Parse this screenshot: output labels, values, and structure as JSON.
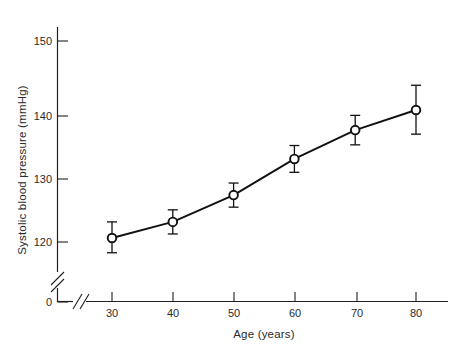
{
  "chart_data": {
    "type": "line",
    "title": "",
    "subtitle": "",
    "xlabel": "Age (years)",
    "ylabel": "Systolic blood pressure (mmHg)",
    "x": [
      30,
      40,
      50,
      60,
      70,
      80
    ],
    "values": [
      120.6,
      123.0,
      127.0,
      132.4,
      136.7,
      139.7
    ],
    "series": [
      {
        "name": "Systolic blood pressure",
        "values": [
          120.6,
          123.0,
          127.0,
          132.4,
          136.7,
          139.7
        ],
        "error_low": [
          118.4,
          121.2,
          125.2,
          130.4,
          134.5,
          136.1
        ],
        "error_high": [
          123.0,
          124.8,
          128.8,
          134.4,
          138.9,
          143.4
        ],
        "marker": "open-circle",
        "line_style": "solid",
        "color": "#111111"
      }
    ],
    "xticks": [
      30,
      40,
      50,
      60,
      70,
      80
    ],
    "xtick_labels": [
      "30",
      "40",
      "50",
      "60",
      "70",
      "80"
    ],
    "yticks": [
      0,
      120,
      130,
      140,
      150
    ],
    "ytick_labels": [
      "0",
      "120",
      "130",
      "140",
      "150"
    ],
    "xlim": [
      24,
      86
    ],
    "ylim": [
      0,
      153
    ],
    "grid": false,
    "legend": false,
    "legend_position": "none",
    "axis_breaks": {
      "y_break_between": [
        0,
        120
      ],
      "x_break_between": [
        0,
        30
      ]
    },
    "annotations": []
  },
  "axis": {
    "y_title": "Systolic blood pressure (mmHg)",
    "x_title": "Age (years)",
    "y_ticks": [
      {
        "label": "150",
        "value": 150
      },
      {
        "label": "140",
        "value": 140
      },
      {
        "label": "130",
        "value": 130
      },
      {
        "label": "120",
        "value": 120
      },
      {
        "label": "0",
        "value": 0
      }
    ],
    "x_ticks": [
      {
        "label": "30",
        "value": 30
      },
      {
        "label": "40",
        "value": 40
      },
      {
        "label": "50",
        "value": 50
      },
      {
        "label": "60",
        "value": 60
      },
      {
        "label": "70",
        "value": 70
      },
      {
        "label": "80",
        "value": 80
      }
    ]
  },
  "colors": {
    "background": "#ffffff",
    "axis": "#1f1f1f",
    "data": "#111111",
    "text": "#2b2b2b",
    "marker_fill": "#ffffff"
  }
}
